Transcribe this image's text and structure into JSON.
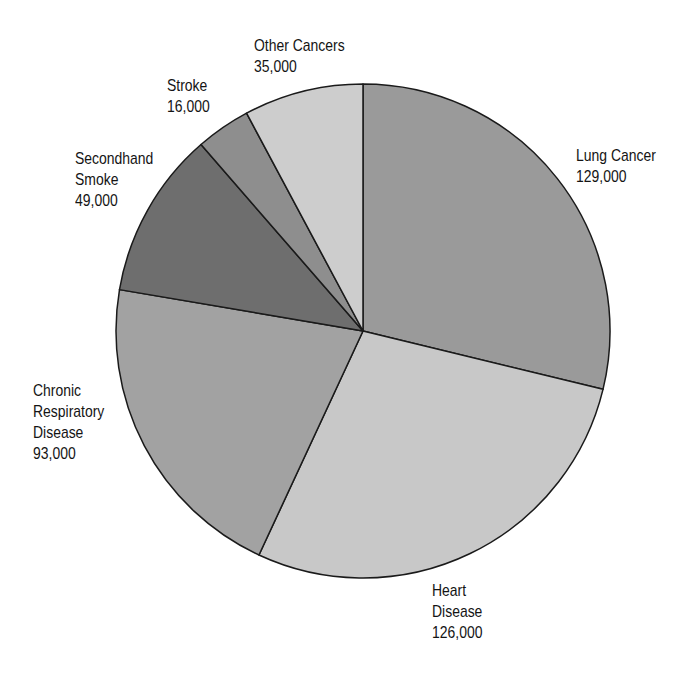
{
  "chart_data": {
    "type": "pie",
    "title": "",
    "start_angle_deg": 0,
    "direction": "clockwise",
    "categories": [
      "Lung Cancer",
      "Heart Disease",
      "Chronic Respiratory Disease",
      "Secondhand Smoke",
      "Stroke",
      "Other Cancers"
    ],
    "values": [
      129000,
      126000,
      93000,
      49000,
      16000,
      35000
    ],
    "colors": [
      "#9a9a9a",
      "#c8c8c8",
      "#a2a2a2",
      "#6e6e6e",
      "#8e8e8e",
      "#cdcdcd"
    ],
    "labels": [
      {
        "lines": [
          "Lung Cancer"
        ],
        "value": "129,000"
      },
      {
        "lines": [
          "Heart",
          "Disease"
        ],
        "value": "126,000"
      },
      {
        "lines": [
          "Chronic",
          "Respiratory",
          "Disease"
        ],
        "value": "93,000"
      },
      {
        "lines": [
          "Secondhand",
          "Smoke"
        ],
        "value": "49,000"
      },
      {
        "lines": [
          "Stroke"
        ],
        "value": "16,000"
      },
      {
        "lines": [
          "Other Cancers"
        ],
        "value": "35,000"
      }
    ],
    "center": [
      363,
      331
    ],
    "radius": 247
  }
}
